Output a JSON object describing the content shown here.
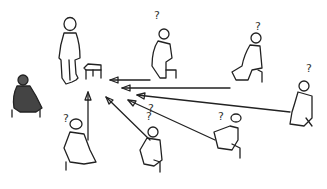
{
  "scene": {
    "description": "Hand-drawn sketch: a standing teacher beside a small stool/box; several seated listeners with question marks point arrows toward the stool; one shaded seated figure on the left",
    "background": "#ffffff",
    "stroke_color": "#222222",
    "question_mark": "?",
    "figures": [
      {
        "name": "standing-figure",
        "pose": "standing",
        "question": false
      },
      {
        "name": "shaded-seated-figure",
        "pose": "seated",
        "shaded": true,
        "question": false
      },
      {
        "name": "seated-figure-1",
        "pose": "seated",
        "question": true
      },
      {
        "name": "seated-figure-2",
        "pose": "seated",
        "question": true
      },
      {
        "name": "seated-figure-3",
        "pose": "seated",
        "question": true
      },
      {
        "name": "seated-figure-4",
        "pose": "seated",
        "question": true
      },
      {
        "name": "seated-figure-5",
        "pose": "seated",
        "question": true
      },
      {
        "name": "seated-figure-6",
        "pose": "seated",
        "question": true
      },
      {
        "name": "seated-figure-7",
        "pose": "seated",
        "question": true
      }
    ],
    "arrow_count": 6,
    "target": "stool"
  }
}
